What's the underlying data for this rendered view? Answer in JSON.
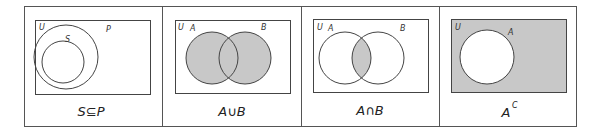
{
  "figure": {
    "colors": {
      "line": "#444444",
      "shade": "#c8c8c8",
      "background": "#ffffff"
    },
    "panels": [
      {
        "id": "subset",
        "universe_label": "U",
        "set_labels": [
          "S",
          "P"
        ],
        "caption": "S⊆P",
        "shaded": "none"
      },
      {
        "id": "union",
        "universe_label": "U",
        "set_labels": [
          "A",
          "B"
        ],
        "caption": "A∪B",
        "shaded": "A or B"
      },
      {
        "id": "intersection",
        "universe_label": "U",
        "set_labels": [
          "A",
          "B"
        ],
        "caption": "A∩B",
        "shaded": "A and B"
      },
      {
        "id": "complement",
        "universe_label": "U",
        "set_labels": [
          "A"
        ],
        "caption_base": "A",
        "caption_sup": "C",
        "shaded": "U minus A"
      }
    ]
  }
}
